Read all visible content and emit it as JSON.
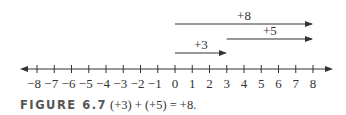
{
  "figure": {
    "label": "FIGURE 6.7",
    "caption": "(+3) + (+5) = +8."
  },
  "number_line": {
    "min": -8,
    "max": 8,
    "tick_labels": [
      "−8",
      "−7",
      "−6",
      "−5",
      "−4",
      "−3",
      "−2",
      "−1",
      "0",
      "1",
      "2",
      "3",
      "4",
      "5",
      "6",
      "7",
      "8"
    ]
  },
  "vectors": [
    {
      "label": "+8",
      "from": 0,
      "to": 8
    },
    {
      "label": "+5",
      "from": 3,
      "to": 8
    },
    {
      "label": "+3",
      "from": 0,
      "to": 3
    }
  ],
  "colors": {
    "line": "#333333",
    "text": "#333333"
  }
}
